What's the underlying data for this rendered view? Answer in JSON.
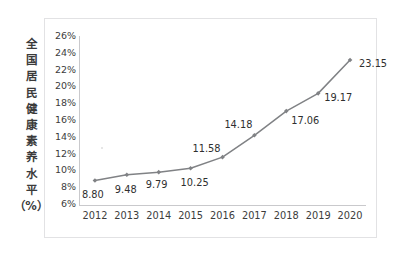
{
  "figure": {
    "background": "#ffffff",
    "frame_border_color": "#e2e2e4",
    "axis_color": "#c9c9cc",
    "series_color": "#808285",
    "text_color": "#3c3c3c"
  },
  "y_axis_title": {
    "full_text": "全国居民健康素养水平（%）",
    "characters": [
      "全",
      "国",
      "居",
      "民",
      "健",
      "康",
      "素",
      "养",
      "水",
      "平",
      "（%）"
    ]
  },
  "chart_data": {
    "type": "line",
    "title": "",
    "subtitle": "",
    "xlabel": "",
    "ylabel": "全国居民健康素养水平（%）",
    "categories": [
      "2012",
      "2013",
      "2014",
      "2015",
      "2016",
      "2017",
      "2018",
      "2019",
      "2020"
    ],
    "values": [
      8.8,
      9.48,
      9.79,
      10.25,
      11.58,
      14.18,
      17.06,
      19.17,
      23.15
    ],
    "point_labels": [
      "8.80",
      "9.48",
      "9.79",
      "10.25",
      "11.58",
      "14.18",
      "17.06",
      "19.17",
      "23.15"
    ],
    "ylim": [
      6,
      26
    ],
    "ytick_values": [
      26,
      24,
      22,
      20,
      18,
      16,
      14,
      12,
      10,
      8,
      6
    ],
    "ytick_labels": [
      "26%",
      "24%",
      "22%",
      "20%",
      "18%",
      "16%",
      "14%",
      "12%",
      "10%",
      "8%",
      "6%"
    ],
    "xtick_labels": [
      "2012",
      "2013",
      "2014",
      "2015",
      "2016",
      "2017",
      "2018",
      "2019",
      "2020"
    ],
    "grid": false,
    "legend": false,
    "legend_position": "none",
    "markers": true,
    "marker_shape": "diamond",
    "line_color": "#808285",
    "series": [
      {
        "name": "全国居民健康素养水平",
        "values": [
          8.8,
          9.48,
          9.79,
          10.25,
          11.58,
          14.18,
          17.06,
          19.17,
          23.15
        ]
      }
    ],
    "label_offsets": [
      {
        "dx": -13,
        "dy": 9
      },
      {
        "dx": -12,
        "dy": 9
      },
      {
        "dx": -13,
        "dy": 7
      },
      {
        "dx": -10,
        "dy": 9
      },
      {
        "dx": -30,
        "dy": -14
      },
      {
        "dx": -30,
        "dy": -16
      },
      {
        "dx": 5,
        "dy": 4
      },
      {
        "dx": 6,
        "dy": -1
      },
      {
        "dx": 9,
        "dy": -2
      }
    ]
  }
}
